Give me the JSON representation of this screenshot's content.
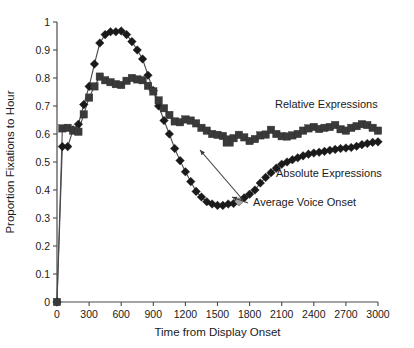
{
  "chart_data": {
    "type": "line",
    "title": "",
    "xlabel": "Time from Display Onset",
    "ylabel": "Proportion Fixations to Hour",
    "xlim": [
      0,
      3000
    ],
    "ylim": [
      0,
      1
    ],
    "xticks": [
      0,
      300,
      600,
      900,
      1200,
      1500,
      1800,
      2100,
      2400,
      2700,
      3000
    ],
    "yticks": [
      0,
      0.1,
      0.2,
      0.3,
      0.4,
      0.5,
      0.6,
      0.7,
      0.8,
      0.9,
      1
    ],
    "grid": false,
    "legend_position": "inline-annotations",
    "x": [
      0,
      50,
      100,
      150,
      200,
      250,
      300,
      350,
      400,
      450,
      500,
      550,
      600,
      650,
      700,
      750,
      800,
      850,
      900,
      950,
      1000,
      1050,
      1100,
      1150,
      1200,
      1250,
      1300,
      1350,
      1400,
      1450,
      1500,
      1550,
      1600,
      1650,
      1700,
      1750,
      1800,
      1850,
      1900,
      1950,
      2000,
      2050,
      2100,
      2150,
      2200,
      2250,
      2300,
      2350,
      2400,
      2450,
      2500,
      2550,
      2600,
      2650,
      2700,
      2750,
      2800,
      2850,
      2900,
      2950,
      3000
    ],
    "series": [
      {
        "name": "Absolute Expressions",
        "marker": "diamond",
        "color": "#1a1a1a",
        "values": [
          0.0,
          0.555,
          0.555,
          0.615,
          0.635,
          0.705,
          0.77,
          0.85,
          0.925,
          0.955,
          0.965,
          0.965,
          0.968,
          0.955,
          0.93,
          0.9,
          0.868,
          0.81,
          0.755,
          0.7,
          0.648,
          0.6,
          0.548,
          0.505,
          0.465,
          0.43,
          0.395,
          0.375,
          0.358,
          0.35,
          0.345,
          0.345,
          0.35,
          0.352,
          0.358,
          0.372,
          0.385,
          0.4,
          0.425,
          0.445,
          0.462,
          0.478,
          0.492,
          0.5,
          0.508,
          0.515,
          0.522,
          0.528,
          0.532,
          0.535,
          0.538,
          0.542,
          0.545,
          0.548,
          0.55,
          0.552,
          0.556,
          0.562,
          0.566,
          0.57,
          0.572
        ]
      },
      {
        "name": "Relative Expressions",
        "marker": "square",
        "color": "#3a3a3a",
        "values": [
          0.0,
          0.62,
          0.622,
          0.612,
          0.608,
          0.67,
          0.73,
          0.77,
          0.805,
          0.792,
          0.785,
          0.778,
          0.775,
          0.79,
          0.8,
          0.795,
          0.792,
          0.772,
          0.752,
          0.72,
          0.692,
          0.668,
          0.645,
          0.642,
          0.652,
          0.648,
          0.638,
          0.622,
          0.612,
          0.6,
          0.597,
          0.593,
          0.575,
          0.585,
          0.597,
          0.588,
          0.575,
          0.582,
          0.595,
          0.598,
          0.615,
          0.6,
          0.592,
          0.591,
          0.595,
          0.6,
          0.612,
          0.62,
          0.625,
          0.618,
          0.622,
          0.625,
          0.632,
          0.617,
          0.612,
          0.622,
          0.628,
          0.635,
          0.632,
          0.622,
          0.612
        ]
      }
    ],
    "annotations": [
      {
        "id": "relative-expressions",
        "label": "Relative Expressions",
        "x_px": 275,
        "y_px": 108
      },
      {
        "id": "absolute-expressions",
        "label": "Absolute Expressions",
        "x_px": 276,
        "y_px": 177
      },
      {
        "id": "average-voice-onset",
        "label": "Average Voice Onset",
        "x_px": 253,
        "y_px": 206
      }
    ],
    "highlight_point": {
      "label": "Average Voice Onset",
      "series": "Absolute Expressions",
      "x": 1700,
      "y": 0.358,
      "color": "#a8a8a8"
    },
    "highlight_marker": {
      "label": "Relative Expressions emphasized point",
      "series": "Relative Expressions",
      "x": 1600,
      "y": 0.575,
      "color": "#3a3a3a"
    }
  }
}
